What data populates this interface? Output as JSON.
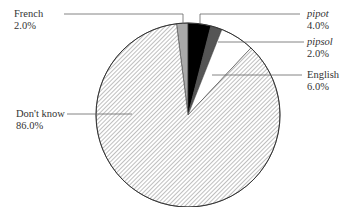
{
  "chart_data": {
    "type": "pie",
    "title": "",
    "categories": [
      "French",
      "pipot",
      "pipsol",
      "English",
      "Don't know"
    ],
    "values": [
      2.0,
      4.0,
      2.0,
      6.0,
      86.0
    ],
    "value_labels": [
      "2.0%",
      "4.0%",
      "2.0%",
      "6.0%",
      "86.0%"
    ],
    "slice_fills": [
      "#a9a9a9",
      "#000000",
      "#555555",
      "#ffffff",
      "hatch"
    ],
    "start_angle_deg": -7.2,
    "direction": "clockwise",
    "legend": "none (leader-line labels)",
    "italic_labels": [
      "pipot",
      "pipsol"
    ]
  },
  "labels": {
    "french": {
      "name": "French",
      "pct": "2.0%"
    },
    "pipot": {
      "name": "pipot",
      "pct": "4.0%"
    },
    "pipsol": {
      "name": "pipsol",
      "pct": "2.0%"
    },
    "english": {
      "name": "English",
      "pct": "6.0%"
    },
    "dontknow": {
      "name": "Don't know",
      "pct": "86.0%"
    }
  }
}
